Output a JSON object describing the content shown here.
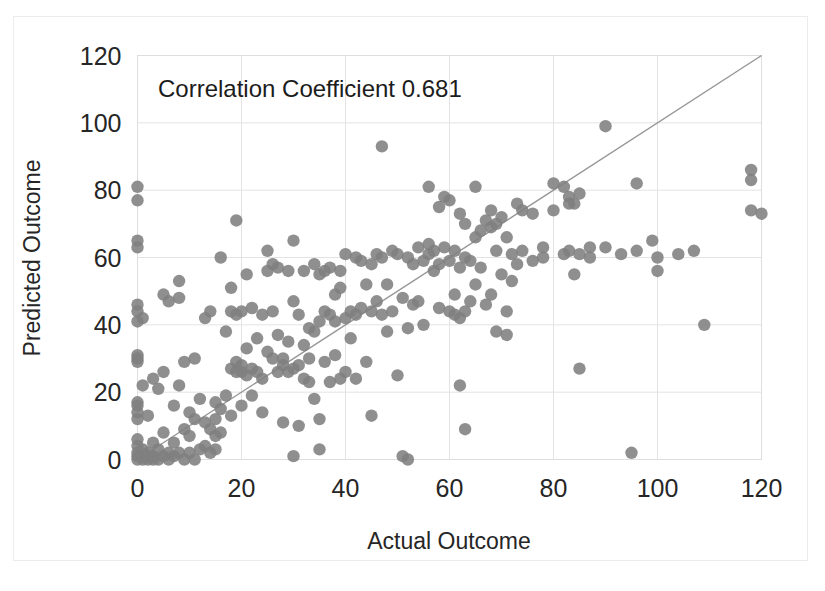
{
  "chart_data": {
    "type": "scatter",
    "title": "",
    "annotation": "Correlation Coefficient 0.681",
    "xlabel": "Actual Outcome",
    "ylabel": "Predicted Outcome",
    "xlim": [
      0,
      120
    ],
    "ylim": [
      0,
      120
    ],
    "xticks": [
      0,
      20,
      40,
      60,
      80,
      100,
      120
    ],
    "yticks": [
      0,
      20,
      40,
      60,
      80,
      100,
      120
    ],
    "xtick_labels": [
      "0",
      "20",
      "40",
      "60",
      "80",
      "100",
      "120"
    ],
    "ytick_labels": [
      "0",
      "20",
      "40",
      "60",
      "80",
      "100",
      "120"
    ],
    "grid": true,
    "legend": "none",
    "marker_color": "#7f7f7f",
    "trendline_color": "#969696",
    "trendline": {
      "label": "identity-reference-line",
      "x": [
        0,
        120
      ],
      "y": [
        0,
        120
      ]
    },
    "series": [
      {
        "name": "Predicted vs Actual",
        "points": [
          [
            0,
            81
          ],
          [
            0,
            77
          ],
          [
            0,
            65
          ],
          [
            0,
            63
          ],
          [
            0,
            46
          ],
          [
            0,
            44
          ],
          [
            0,
            41
          ],
          [
            0,
            31
          ],
          [
            0,
            30
          ],
          [
            0,
            29
          ],
          [
            0,
            17
          ],
          [
            0,
            16
          ],
          [
            0,
            14
          ],
          [
            0,
            12
          ],
          [
            0,
            6
          ],
          [
            0,
            4
          ],
          [
            0,
            2
          ],
          [
            0,
            1
          ],
          [
            0,
            0
          ],
          [
            1,
            42
          ],
          [
            1,
            22
          ],
          [
            1,
            3
          ],
          [
            1,
            1
          ],
          [
            1,
            0
          ],
          [
            2,
            13
          ],
          [
            2,
            2
          ],
          [
            2,
            1
          ],
          [
            2,
            0
          ],
          [
            3,
            24
          ],
          [
            3,
            5
          ],
          [
            3,
            1
          ],
          [
            3,
            0
          ],
          [
            4,
            21
          ],
          [
            4,
            3
          ],
          [
            4,
            0
          ],
          [
            5,
            49
          ],
          [
            5,
            26
          ],
          [
            5,
            8
          ],
          [
            5,
            1
          ],
          [
            6,
            47
          ],
          [
            6,
            2
          ],
          [
            6,
            0
          ],
          [
            7,
            16
          ],
          [
            7,
            5
          ],
          [
            7,
            1
          ],
          [
            8,
            53
          ],
          [
            8,
            48
          ],
          [
            8,
            22
          ],
          [
            8,
            2
          ],
          [
            9,
            29
          ],
          [
            9,
            9
          ],
          [
            9,
            0
          ],
          [
            10,
            14
          ],
          [
            10,
            7
          ],
          [
            10,
            2
          ],
          [
            11,
            30
          ],
          [
            11,
            12
          ],
          [
            11,
            0
          ],
          [
            12,
            18
          ],
          [
            12,
            3
          ],
          [
            13,
            42
          ],
          [
            13,
            11
          ],
          [
            13,
            4
          ],
          [
            14,
            44
          ],
          [
            14,
            9
          ],
          [
            14,
            2
          ],
          [
            15,
            17
          ],
          [
            15,
            12
          ],
          [
            15,
            7
          ],
          [
            15,
            3
          ],
          [
            16,
            60
          ],
          [
            16,
            15
          ],
          [
            16,
            8
          ],
          [
            17,
            38
          ],
          [
            17,
            19
          ],
          [
            18,
            51
          ],
          [
            18,
            44
          ],
          [
            18,
            27
          ],
          [
            18,
            13
          ],
          [
            19,
            71
          ],
          [
            19,
            43
          ],
          [
            19,
            29
          ],
          [
            19,
            26
          ],
          [
            20,
            44
          ],
          [
            20,
            28
          ],
          [
            20,
            26
          ],
          [
            20,
            16
          ],
          [
            21,
            55
          ],
          [
            21,
            33
          ],
          [
            21,
            25
          ],
          [
            22,
            45
          ],
          [
            22,
            27
          ],
          [
            22,
            19
          ],
          [
            23,
            36
          ],
          [
            23,
            26
          ],
          [
            24,
            43
          ],
          [
            24,
            24
          ],
          [
            24,
            14
          ],
          [
            25,
            62
          ],
          [
            25,
            56
          ],
          [
            25,
            32
          ],
          [
            26,
            58
          ],
          [
            26,
            44
          ],
          [
            26,
            30
          ],
          [
            27,
            57
          ],
          [
            27,
            37
          ],
          [
            27,
            26
          ],
          [
            28,
            30
          ],
          [
            28,
            28
          ],
          [
            28,
            11
          ],
          [
            29,
            56
          ],
          [
            29,
            35
          ],
          [
            29,
            26
          ],
          [
            30,
            65
          ],
          [
            30,
            47
          ],
          [
            30,
            27
          ],
          [
            30,
            1
          ],
          [
            31,
            43
          ],
          [
            31,
            28
          ],
          [
            31,
            10
          ],
          [
            32,
            56
          ],
          [
            32,
            34
          ],
          [
            32,
            24
          ],
          [
            33,
            39
          ],
          [
            33,
            30
          ],
          [
            33,
            23
          ],
          [
            34,
            58
          ],
          [
            34,
            38
          ],
          [
            34,
            18
          ],
          [
            35,
            55
          ],
          [
            35,
            41
          ],
          [
            35,
            12
          ],
          [
            35,
            3
          ],
          [
            36,
            56
          ],
          [
            36,
            44
          ],
          [
            36,
            29
          ],
          [
            37,
            57
          ],
          [
            37,
            43
          ],
          [
            37,
            23
          ],
          [
            38,
            49
          ],
          [
            38,
            41
          ],
          [
            38,
            31
          ],
          [
            39,
            56
          ],
          [
            39,
            51
          ],
          [
            39,
            24
          ],
          [
            40,
            61
          ],
          [
            40,
            42
          ],
          [
            40,
            26
          ],
          [
            41,
            44
          ],
          [
            41,
            36
          ],
          [
            42,
            60
          ],
          [
            42,
            43
          ],
          [
            42,
            24
          ],
          [
            43,
            59
          ],
          [
            43,
            45
          ],
          [
            44,
            52
          ],
          [
            44,
            29
          ],
          [
            45,
            58
          ],
          [
            45,
            44
          ],
          [
            45,
            13
          ],
          [
            46,
            61
          ],
          [
            46,
            47
          ],
          [
            47,
            93
          ],
          [
            47,
            60
          ],
          [
            47,
            43
          ],
          [
            48,
            52
          ],
          [
            48,
            38
          ],
          [
            49,
            62
          ],
          [
            49,
            44
          ],
          [
            50,
            61
          ],
          [
            50,
            25
          ],
          [
            51,
            48
          ],
          [
            51,
            1
          ],
          [
            52,
            60
          ],
          [
            52,
            39
          ],
          [
            52,
            0
          ],
          [
            53,
            58
          ],
          [
            53,
            46
          ],
          [
            54,
            63
          ],
          [
            54,
            47
          ],
          [
            55,
            59
          ],
          [
            55,
            40
          ],
          [
            56,
            81
          ],
          [
            56,
            64
          ],
          [
            56,
            61
          ],
          [
            57,
            62
          ],
          [
            57,
            56
          ],
          [
            58,
            75
          ],
          [
            58,
            58
          ],
          [
            58,
            45
          ],
          [
            59,
            78
          ],
          [
            59,
            63
          ],
          [
            60,
            77
          ],
          [
            60,
            59
          ],
          [
            60,
            44
          ],
          [
            61,
            62
          ],
          [
            61,
            49
          ],
          [
            61,
            43
          ],
          [
            62,
            73
          ],
          [
            62,
            57
          ],
          [
            62,
            42
          ],
          [
            62,
            22
          ],
          [
            63,
            70
          ],
          [
            63,
            60
          ],
          [
            63,
            44
          ],
          [
            63,
            9
          ],
          [
            64,
            59
          ],
          [
            64,
            47
          ],
          [
            65,
            81
          ],
          [
            65,
            66
          ],
          [
            65,
            52
          ],
          [
            66,
            68
          ],
          [
            66,
            57
          ],
          [
            67,
            71
          ],
          [
            67,
            46
          ],
          [
            68,
            74
          ],
          [
            68,
            69
          ],
          [
            68,
            49
          ],
          [
            69,
            70
          ],
          [
            69,
            62
          ],
          [
            69,
            38
          ],
          [
            70,
            72
          ],
          [
            70,
            55
          ],
          [
            71,
            66
          ],
          [
            71,
            44
          ],
          [
            71,
            37
          ],
          [
            72,
            61
          ],
          [
            72,
            53
          ],
          [
            73,
            76
          ],
          [
            73,
            58
          ],
          [
            74,
            74
          ],
          [
            74,
            62
          ],
          [
            76,
            73
          ],
          [
            76,
            59
          ],
          [
            78,
            63
          ],
          [
            78,
            60
          ],
          [
            80,
            82
          ],
          [
            80,
            74
          ],
          [
            82,
            81
          ],
          [
            82,
            61
          ],
          [
            83,
            78
          ],
          [
            83,
            76
          ],
          [
            83,
            62
          ],
          [
            84,
            76
          ],
          [
            84,
            55
          ],
          [
            85,
            79
          ],
          [
            85,
            61
          ],
          [
            85,
            27
          ],
          [
            87,
            63
          ],
          [
            87,
            60
          ],
          [
            90,
            99
          ],
          [
            90,
            63
          ],
          [
            93,
            61
          ],
          [
            95,
            2
          ],
          [
            96,
            82
          ],
          [
            96,
            62
          ],
          [
            99,
            65
          ],
          [
            100,
            56
          ],
          [
            100,
            60
          ],
          [
            104,
            61
          ],
          [
            107,
            62
          ],
          [
            109,
            40
          ],
          [
            118,
            86
          ],
          [
            118,
            83
          ],
          [
            118,
            74
          ],
          [
            120,
            73
          ]
        ]
      }
    ]
  },
  "axes": {
    "xlabel": "Actual Outcome",
    "ylabel": "Predicted Outcome",
    "annotation": "Correlation Coefficient 0.681"
  }
}
